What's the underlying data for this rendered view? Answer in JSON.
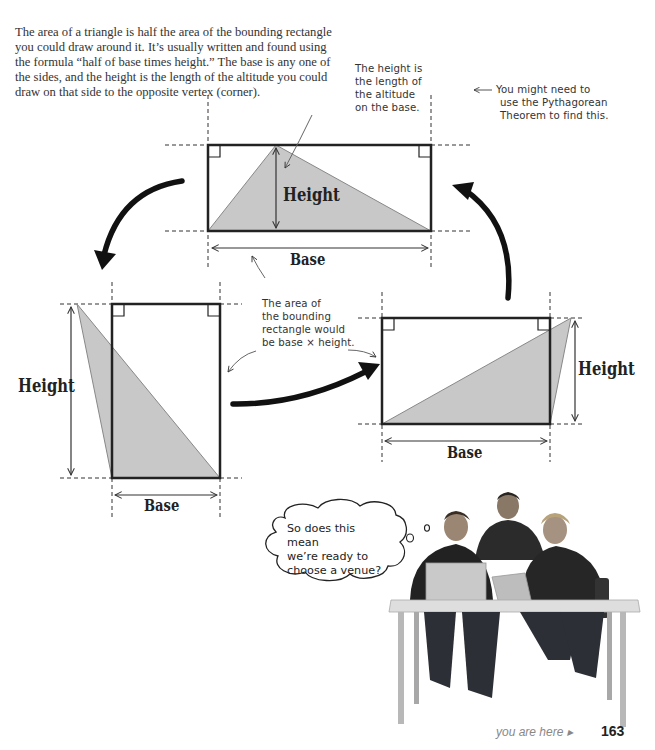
{
  "intro_text": "The area of a triangle is half the area of the bounding rectangle you could draw around it. It’s usually written and found using the formula “half of base times height.” The base is any one of the sides, and the height is the length of the altitude you could draw on that side to the opposite vertex (corner).",
  "annotations": {
    "height_note": [
      "The height is",
      "the length of",
      "the altitude",
      "on the base."
    ],
    "pythagorean_note": [
      "You might need to",
      "use the Pythagorean",
      "Theorem to find this."
    ],
    "area_note": [
      "The area of",
      "the bounding",
      "rectangle would",
      "be base × height."
    ]
  },
  "diagrams": {
    "top": {
      "height_label": "Height",
      "base_label": "Base"
    },
    "left": {
      "height_label": "Height",
      "base_label": "Base"
    },
    "right": {
      "height_label": "Height",
      "base_label": "Base"
    }
  },
  "thought_bubble": {
    "lines": [
      "So does this mean",
      "we’re ready to",
      "choose a venue?"
    ]
  },
  "footer": {
    "you_are_here": "you are here ▸",
    "page_number": "163"
  },
  "colors": {
    "triangle_fill": "#c8c8c8",
    "outline": "#222222",
    "text": "#333333"
  }
}
